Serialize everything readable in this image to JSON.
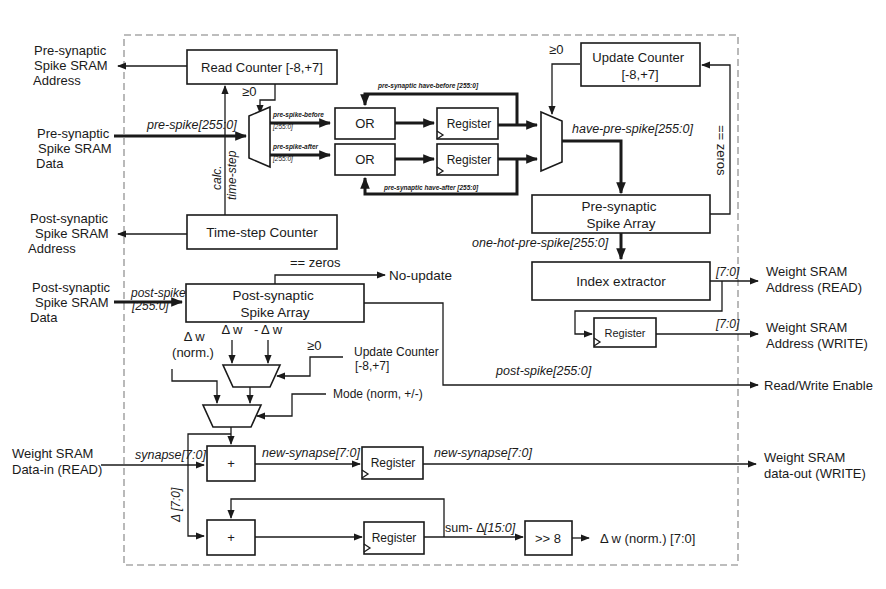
{
  "external": {
    "pre_addr": [
      "Pre-synaptic",
      "Spike SRAM",
      "Address"
    ],
    "pre_data": [
      "Pre-synaptic",
      "Spike SRAM",
      "Data"
    ],
    "post_addr": [
      "Post-synaptic",
      "Spike SRAM",
      "Address"
    ],
    "post_data": [
      "Post-synaptic",
      "Spike SRAM",
      "Data"
    ],
    "w_data_in": [
      "Weight SRAM",
      "Data-in (READ)"
    ],
    "w_addr_read": [
      "Weight SRAM",
      "Address (READ)"
    ],
    "w_addr_write": [
      "Weight SRAM",
      "Address (WRITE)"
    ],
    "rw_enable": "Read/Write Enable",
    "w_data_out": [
      "Weight SRAM",
      "data-out (WRITE)"
    ]
  },
  "blocks": {
    "read_counter": "Read Counter [-8,+7]",
    "update_counter": [
      "Update Counter",
      "[-8,+7]"
    ],
    "or_top": "OR",
    "or_bottom": "OR",
    "reg_top": "Register",
    "reg_bottom": "Register",
    "pre_array": [
      "Pre-synaptic",
      "Spike Array"
    ],
    "time_step_counter": "Time-step Counter",
    "index_extractor": "Index extractor",
    "post_array": [
      "Post-synaptic",
      "Spike Array"
    ],
    "reg_addr": "Register",
    "adder_top": "+",
    "reg_synapse": "Register",
    "adder_bottom": "+",
    "reg_sum": "Register",
    "shift": ">> 8"
  },
  "signals": {
    "geq0_read": "≥0",
    "geq0_update": "≥0",
    "geq0_mode": "≥0",
    "pre_spike": "pre-spike[255:0]",
    "pre_spike_before": "pre-spike-before",
    "pre_spike_before_w": "[255:0]",
    "pre_spike_after": "pre-spike-after",
    "pre_spike_after_w": "[255:0]",
    "have_before": "pre-synaptic have-before [255:0]",
    "have_after": "pre-synaptic have-after [255:0]",
    "have_pre_spike": "have-pre-spike[255:0]",
    "eq_zeros_right": "== zeros",
    "calc_time_step": [
      "calc.",
      "time-step"
    ],
    "one_hot": "one-hot-pre-spike[255:0]",
    "addr_read_w": "[7:0]",
    "addr_write_w": "[7:0]",
    "eq_zeros_post": "== zeros",
    "no_update": "No-update",
    "post_spike_in": "post-spike",
    "post_spike_in_w": "[255:0]",
    "post_spike_out": "post-spike[255:0]",
    "dw_norm": [
      "Δ w",
      "(norm.)"
    ],
    "dw": "Δ w",
    "neg_dw": "- Δ w",
    "update_counter_ref": [
      "Update Counter",
      "[-8,+7]"
    ],
    "mode": "Mode (norm, +/-)",
    "synapse": "synapse[7:0]",
    "new_synapse_a": "new-synapse[7:0]",
    "new_synapse_b": "new-synapse[7:0]",
    "delta": "Δ [7:0]",
    "sum_delta": "sum- Δ",
    "sum_delta_w": "[15:0]",
    "dw_norm_out": "Δ w (norm.) [7:0]"
  }
}
